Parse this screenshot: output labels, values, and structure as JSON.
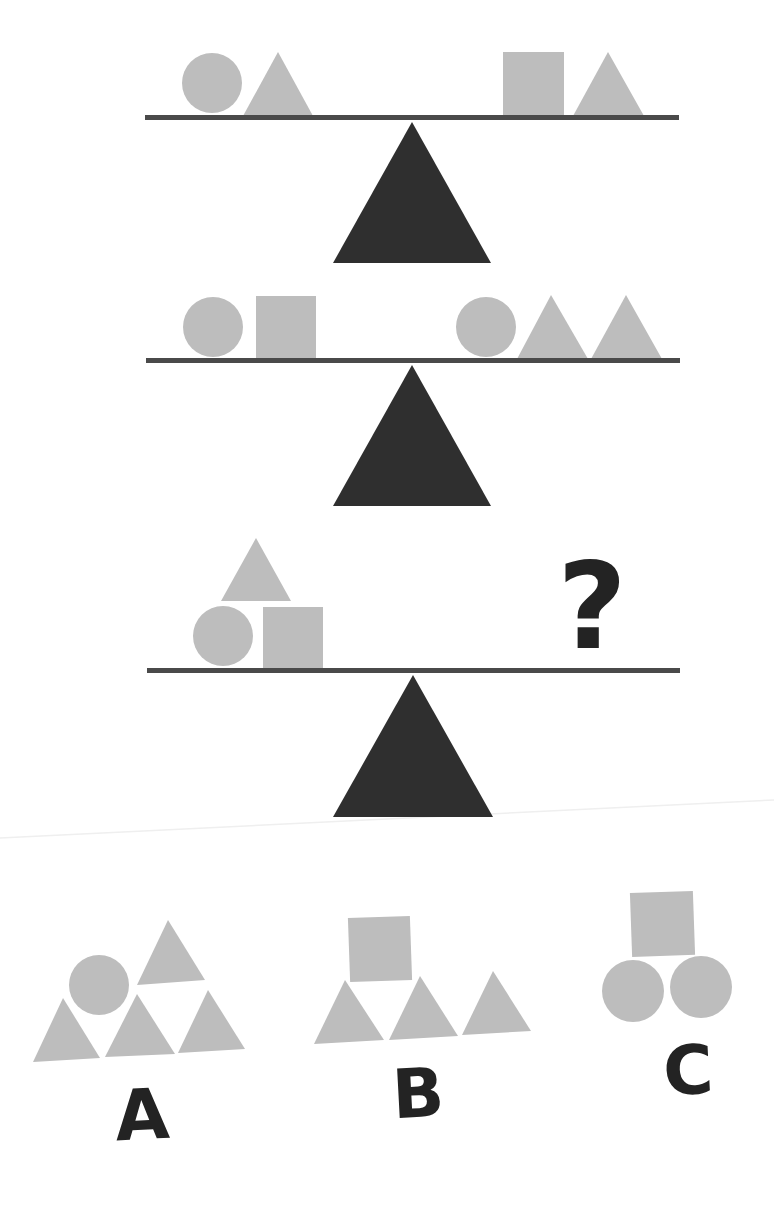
{
  "colors": {
    "shape": "#bdbdbd",
    "beam": "#4a4a4a",
    "fulcrum": "#2f2f2f",
    "text": "#232323",
    "background": "#ffffff"
  },
  "puzzle": {
    "type": "balance-scale",
    "scales": [
      {
        "index": 1,
        "left": [
          "circle",
          "triangle"
        ],
        "right": [
          "square",
          "triangle"
        ],
        "balanced": true
      },
      {
        "index": 2,
        "left": [
          "circle",
          "square"
        ],
        "right": [
          "circle",
          "triangle",
          "triangle"
        ],
        "balanced": true
      },
      {
        "index": 3,
        "left": [
          "triangle",
          "circle",
          "square"
        ],
        "right": [
          "?"
        ],
        "balanced": true,
        "unknown_symbol": "?"
      }
    ],
    "options": [
      {
        "label": "A",
        "shapes": [
          "circle",
          "triangle",
          "triangle",
          "triangle",
          "triangle"
        ]
      },
      {
        "label": "B",
        "shapes": [
          "square",
          "triangle",
          "triangle",
          "triangle"
        ]
      },
      {
        "label": "C",
        "shapes": [
          "square",
          "circle",
          "circle"
        ]
      }
    ]
  }
}
